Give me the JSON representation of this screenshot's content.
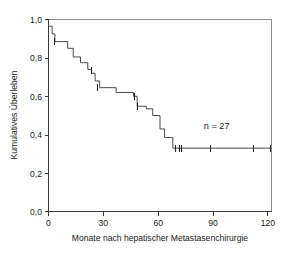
{
  "chart_data": {
    "type": "line",
    "subtype": "kaplan-meier-survival",
    "title": "",
    "xlabel": "Monate nach hepatischer Metastasenchirurgie",
    "ylabel": "Kumulatives Überleben",
    "xlim": [
      0,
      122
    ],
    "ylim": [
      0.0,
      1.0
    ],
    "grid": false,
    "legend": null,
    "xticks": [
      0,
      30,
      60,
      90,
      120
    ],
    "xtick_labels": [
      "0",
      "30",
      "60",
      "90",
      "120"
    ],
    "yticks": [
      0.0,
      0.2,
      0.4,
      0.6,
      0.8,
      1.0
    ],
    "ytick_labels": [
      "0,0",
      "0,2",
      "0,4",
      "0,6",
      "0,8",
      "1,0"
    ],
    "annotations": [
      {
        "text": "n = 27",
        "x": 92,
        "y": 0.43
      }
    ],
    "series": [
      {
        "name": "Kumulatives Überleben",
        "step": "post",
        "x": [
          0,
          2.0,
          2.0,
          3.5,
          3.5,
          10.5,
          10.5,
          13.5,
          13.5,
          17.5,
          17.5,
          21.5,
          21.5,
          23.5,
          23.5,
          25.5,
          25.5,
          28.0,
          28.0,
          37.0,
          37.0,
          46.5,
          46.5,
          48.5,
          48.5,
          53.5,
          53.5,
          57.0,
          57.0,
          61.0,
          61.0,
          63.5,
          63.5,
          68.0,
          68.0,
          122.0
        ],
        "y": [
          0.965,
          0.965,
          0.925,
          0.925,
          0.885,
          0.885,
          0.85,
          0.85,
          0.805,
          0.805,
          0.775,
          0.775,
          0.74,
          0.74,
          0.72,
          0.72,
          0.68,
          0.68,
          0.645,
          0.645,
          0.62,
          0.62,
          0.6,
          0.6,
          0.548,
          0.548,
          0.535,
          0.535,
          0.5,
          0.5,
          0.43,
          0.43,
          0.385,
          0.385,
          0.33,
          0.33
        ]
      }
    ],
    "censored_points": [
      {
        "x": 3.5,
        "y": 0.885
      },
      {
        "x": 23.5,
        "y": 0.735
      },
      {
        "x": 27.0,
        "y": 0.645
      },
      {
        "x": 47.0,
        "y": 0.6
      },
      {
        "x": 48.5,
        "y": 0.548
      },
      {
        "x": 69.5,
        "y": 0.33
      },
      {
        "x": 71.5,
        "y": 0.33
      },
      {
        "x": 73.0,
        "y": 0.33
      },
      {
        "x": 88.5,
        "y": 0.33
      },
      {
        "x": 112.0,
        "y": 0.33
      },
      {
        "x": 121.5,
        "y": 0.33
      }
    ]
  },
  "figure": {
    "background_color": "#ffffff",
    "axis_color": "#3a3a3a",
    "curve_color": "#4a4a4a",
    "censor_color": "#222222"
  }
}
